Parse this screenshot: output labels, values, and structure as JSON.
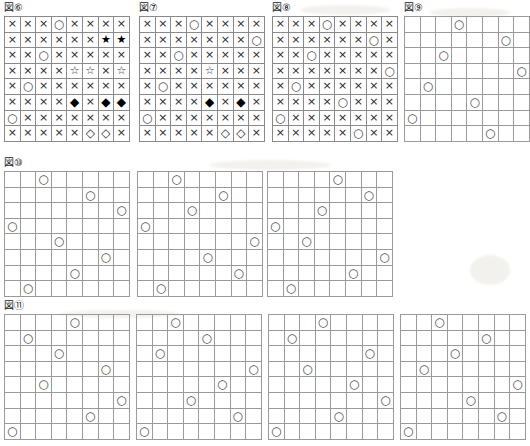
{
  "document": {
    "kind": "worksheet-figures",
    "glyph_map": {
      "x": "×",
      "o": "○",
      "star_filled": "★",
      "star_open": "☆",
      "diamond_filled": "◆",
      "diamond_open": "◇",
      "empty": ""
    },
    "grid_size": 8,
    "colors": {
      "border": "#8a8a8a",
      "glyph": "#222222",
      "circle": "#4a4a4a",
      "background": "#ffffff"
    }
  },
  "figures": [
    {
      "id": "fig-6",
      "label": "図⑥",
      "has_label": true,
      "rows": [
        [
          "x",
          "x",
          "x",
          "o",
          "x",
          "x",
          "x",
          "x"
        ],
        [
          "x",
          "x",
          "x",
          "x",
          "x",
          "x",
          "star_filled",
          "star_filled"
        ],
        [
          "x",
          "x",
          "o",
          "x",
          "x",
          "x",
          "x",
          "x"
        ],
        [
          "x",
          "x",
          "x",
          "x",
          "star_open",
          "star_open",
          "x",
          "star_open"
        ],
        [
          "x",
          "o",
          "x",
          "x",
          "x",
          "x",
          "x",
          "x"
        ],
        [
          "x",
          "x",
          "x",
          "x",
          "diamond_filled",
          "x",
          "diamond_filled",
          "diamond_filled"
        ],
        [
          "o",
          "x",
          "x",
          "x",
          "x",
          "x",
          "x",
          "x"
        ],
        [
          "x",
          "x",
          "x",
          "x",
          "x",
          "diamond_open",
          "diamond_open",
          "x"
        ]
      ]
    },
    {
      "id": "fig-7",
      "label": "図⑦",
      "has_label": true,
      "rows": [
        [
          "x",
          "x",
          "x",
          "o",
          "x",
          "x",
          "x",
          "x"
        ],
        [
          "x",
          "x",
          "x",
          "x",
          "x",
          "x",
          "x",
          "o"
        ],
        [
          "x",
          "x",
          "o",
          "x",
          "x",
          "x",
          "x",
          "x"
        ],
        [
          "x",
          "x",
          "x",
          "x",
          "star_open",
          "x",
          "x",
          "x"
        ],
        [
          "x",
          "o",
          "x",
          "x",
          "x",
          "x",
          "x",
          "x"
        ],
        [
          "x",
          "x",
          "x",
          "x",
          "diamond_filled",
          "x",
          "diamond_filled",
          "x"
        ],
        [
          "o",
          "x",
          "x",
          "x",
          "x",
          "x",
          "x",
          "x"
        ],
        [
          "x",
          "x",
          "x",
          "x",
          "x",
          "diamond_open",
          "diamond_open",
          "x"
        ]
      ]
    },
    {
      "id": "fig-8",
      "label": "図⑧",
      "has_label": true,
      "rows": [
        [
          "x",
          "x",
          "x",
          "o",
          "x",
          "x",
          "x",
          "x"
        ],
        [
          "x",
          "x",
          "x",
          "x",
          "x",
          "x",
          "o",
          "x"
        ],
        [
          "x",
          "x",
          "o",
          "x",
          "x",
          "x",
          "x",
          "x"
        ],
        [
          "x",
          "x",
          "x",
          "x",
          "x",
          "x",
          "x",
          "o"
        ],
        [
          "x",
          "o",
          "x",
          "x",
          "x",
          "x",
          "x",
          "x"
        ],
        [
          "x",
          "x",
          "x",
          "x",
          "o",
          "x",
          "x",
          "x"
        ],
        [
          "o",
          "x",
          "x",
          "x",
          "x",
          "x",
          "x",
          "x"
        ],
        [
          "x",
          "x",
          "x",
          "x",
          "x",
          "o",
          "x",
          "x"
        ]
      ]
    },
    {
      "id": "fig-9",
      "label": "図⑨",
      "has_label": true,
      "queens": [
        4,
        7,
        3,
        8,
        2,
        5,
        1,
        6
      ]
    },
    {
      "id": "fig-10-a",
      "label": "図⑩",
      "has_label": true,
      "queens": [
        3,
        6,
        8,
        1,
        4,
        7,
        5,
        2
      ]
    },
    {
      "id": "fig-10-b",
      "label": "",
      "has_label": false,
      "queens": [
        3,
        6,
        4,
        1,
        8,
        5,
        7,
        2
      ]
    },
    {
      "id": "fig-10-c",
      "label": "",
      "has_label": false,
      "queens": [
        5,
        7,
        4,
        1,
        3,
        8,
        6,
        2
      ]
    },
    {
      "id": "fig-11-a",
      "label": "図⑪",
      "has_label": true,
      "queens": [
        5,
        2,
        4,
        7,
        3,
        8,
        6,
        1
      ]
    },
    {
      "id": "fig-11-b",
      "label": "",
      "has_label": false,
      "queens": [
        3,
        5,
        2,
        8,
        6,
        4,
        7,
        1
      ]
    },
    {
      "id": "fig-11-c",
      "label": "",
      "has_label": false,
      "queens": [
        4,
        2,
        7,
        3,
        6,
        8,
        5,
        1
      ]
    },
    {
      "id": "fig-11-d",
      "label": "",
      "has_label": false,
      "queens": [
        3,
        6,
        4,
        2,
        8,
        5,
        7,
        1
      ]
    }
  ],
  "layout": {
    "positions": [
      {
        "id": "fig-6",
        "left": 4,
        "top": 2
      },
      {
        "id": "fig-7",
        "left": 139,
        "top": 2
      },
      {
        "id": "fig-8",
        "left": 272,
        "top": 2
      },
      {
        "id": "fig-9",
        "left": 404,
        "top": 2
      },
      {
        "id": "fig-10-a",
        "left": 4,
        "top": 157
      },
      {
        "id": "fig-10-b",
        "left": 137,
        "top": 157
      },
      {
        "id": "fig-10-c",
        "left": 267,
        "top": 157
      },
      {
        "id": "fig-11-a",
        "left": 4,
        "top": 300
      },
      {
        "id": "fig-11-b",
        "left": 136,
        "top": 300
      },
      {
        "id": "fig-11-c",
        "left": 268,
        "top": 300
      },
      {
        "id": "fig-11-d",
        "left": 400,
        "top": 300
      }
    ]
  }
}
